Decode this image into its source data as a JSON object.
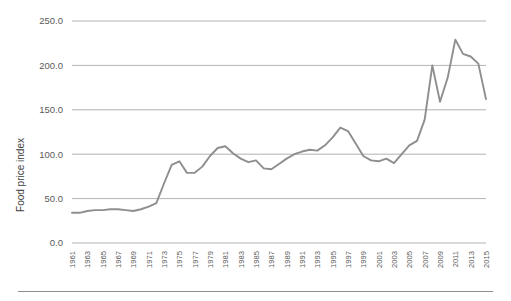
{
  "chart_data": {
    "type": "line",
    "title": "",
    "xlabel": "",
    "ylabel": "Food price index",
    "ylim": [
      0,
      250
    ],
    "xlim": [
      1961,
      2015
    ],
    "grid": true,
    "legend": false,
    "line_color": "#8e8e8e",
    "gridline_color": "#b3b3b3",
    "background_color": "#ffffff",
    "ytick_labels": [
      "250.0",
      "200.0",
      "150.0",
      "100.0",
      "50.0",
      "0.0"
    ],
    "ytick_values": [
      250,
      200,
      150,
      100,
      50,
      0
    ],
    "xtick_labels": [
      "1961",
      "1963",
      "1965",
      "1967",
      "1969",
      "1971",
      "1973",
      "1975",
      "1977",
      "1979",
      "1981",
      "1983",
      "1985",
      "1987",
      "1989",
      "1991",
      "1993",
      "1995",
      "1997",
      "1999",
      "2001",
      "2003",
      "2005",
      "2007",
      "2009",
      "2011",
      "2013",
      "2015"
    ],
    "x": [
      1961,
      1962,
      1963,
      1964,
      1965,
      1966,
      1967,
      1968,
      1969,
      1970,
      1971,
      1972,
      1973,
      1974,
      1975,
      1976,
      1977,
      1978,
      1979,
      1980,
      1981,
      1982,
      1983,
      1984,
      1985,
      1986,
      1987,
      1988,
      1989,
      1990,
      1991,
      1992,
      1993,
      1994,
      1995,
      1996,
      1997,
      1998,
      1999,
      2000,
      2001,
      2002,
      2003,
      2004,
      2005,
      2006,
      2007,
      2008,
      2009,
      2010,
      2011,
      2012,
      2013,
      2014,
      2015
    ],
    "values": [
      34,
      34,
      36,
      37,
      37,
      38,
      38,
      37,
      36,
      38,
      41,
      45,
      67,
      88,
      92,
      79,
      79,
      86,
      98,
      107,
      109,
      101,
      95,
      91,
      93,
      84,
      83,
      89,
      95,
      100,
      103,
      105,
      104,
      110,
      119,
      130,
      126,
      112,
      98,
      93,
      92,
      95,
      90,
      100,
      110,
      115,
      139,
      200,
      159,
      186,
      229,
      213,
      210,
      202,
      162
    ]
  }
}
